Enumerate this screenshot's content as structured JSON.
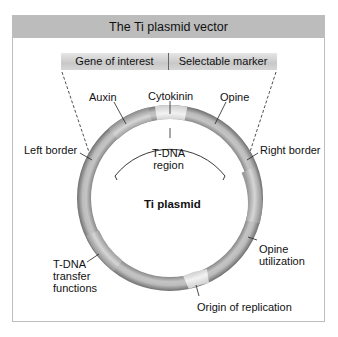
{
  "title": "The Ti plasmid vector",
  "insert": {
    "left_label": "Gene of interest",
    "right_label": "Selectable marker"
  },
  "plasmid": {
    "name": "Ti plasmid",
    "tdna_region_line1": "T-DNA",
    "tdna_region_line2": "region"
  },
  "labels": {
    "auxin": "Auxin",
    "cytokinin": "Cytokinin",
    "opine": "Opine",
    "left_border": "Left border",
    "right_border": "Right border",
    "opine_utilization_line1": "Opine",
    "opine_utilization_line2": "utilization",
    "tdna_transfer_line1": "T-DNA",
    "tdna_transfer_line2": "transfer",
    "tdna_transfer_line3": "functions",
    "origin_of_replication": "Origin of replication"
  },
  "colors": {
    "header_bg": "#bcbcbc",
    "ring_dark": "#8a8a8a",
    "ring_light": "#d8d8d8",
    "frame_border": "#bdbdbd"
  }
}
